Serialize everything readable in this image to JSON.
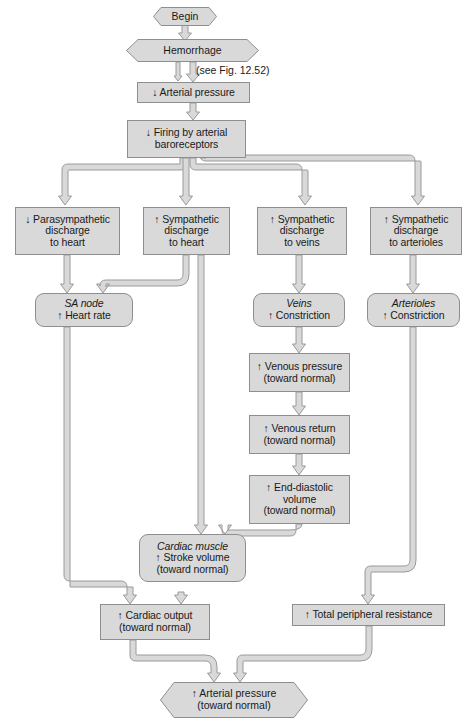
{
  "figure": {
    "type": "flowchart",
    "box_fill": "#d9d9d9",
    "box_stroke": "#8e8e8e",
    "connector_fill": "#d9d9d9",
    "connector_stroke": "#9a9a9a",
    "background": "#ffffff"
  },
  "annotations": {
    "figure_reference": "(see Fig. 12.52)"
  },
  "nodes": {
    "begin": {
      "label": "Begin",
      "shape": "hexagon"
    },
    "hemorrhage": {
      "label": "Hemorrhage",
      "shape": "hexagon"
    },
    "arterial_pressure_down": {
      "label": "↓ Arterial pressure",
      "shape": "rect"
    },
    "baroreceptors": {
      "line1": "↓ Firing by arterial",
      "line2": "baroreceptors",
      "shape": "rect"
    },
    "parasympathetic_heart": {
      "line1": "↓ Parasympathetic",
      "line2": "discharge",
      "line3": "to heart",
      "shape": "rect"
    },
    "sympathetic_heart": {
      "line1": "↑ Sympathetic",
      "line2": "discharge",
      "line3": "to heart",
      "shape": "rect"
    },
    "sympathetic_veins": {
      "line1": "↑ Sympathetic",
      "line2": "discharge",
      "line3": "to veins",
      "shape": "rect"
    },
    "sympathetic_arterioles": {
      "line1": "↑ Sympathetic",
      "line2": "discharge",
      "line3": "to arterioles",
      "shape": "rect"
    },
    "sa_node": {
      "organ": "SA node",
      "line1": "↑ Heart rate",
      "shape": "rounded-rect"
    },
    "veins": {
      "organ": "Veins",
      "line1": "↑ Constriction",
      "shape": "rounded-rect"
    },
    "arterioles": {
      "organ": "Arterioles",
      "line1": "↑ Constriction",
      "shape": "rounded-rect"
    },
    "venous_pressure": {
      "line1": "↑ Venous pressure",
      "line2": "(toward normal)",
      "shape": "rect"
    },
    "venous_return": {
      "line1": "↑ Venous return",
      "line2": "(toward normal)",
      "shape": "rect"
    },
    "end_diastolic_volume": {
      "line1": "↑ End-diastolic",
      "line2": "volume",
      "line3": "(toward normal)",
      "shape": "rect"
    },
    "cardiac_muscle": {
      "organ": "Cardiac muscle",
      "line1": "↑ Stroke volume",
      "line2": "(toward normal)",
      "shape": "rounded-rect"
    },
    "cardiac_output": {
      "line1": "↑ Cardiac output",
      "line2": "(toward normal)",
      "shape": "rect"
    },
    "total_peripheral_resistance": {
      "label": "↑ Total peripheral resistance",
      "shape": "rect"
    },
    "arterial_pressure_up": {
      "line1": "↑ Arterial pressure",
      "line2": "(toward normal)",
      "shape": "hexagon"
    }
  },
  "edges": [
    {
      "from": "begin",
      "to": "hemorrhage"
    },
    {
      "from": "hemorrhage",
      "to": "arterial_pressure_down"
    },
    {
      "from": "arterial_pressure_down",
      "to": "baroreceptors"
    },
    {
      "from": "baroreceptors",
      "to": "parasympathetic_heart"
    },
    {
      "from": "baroreceptors",
      "to": "sympathetic_heart"
    },
    {
      "from": "baroreceptors",
      "to": "sympathetic_veins"
    },
    {
      "from": "baroreceptors",
      "to": "sympathetic_arterioles"
    },
    {
      "from": "parasympathetic_heart",
      "to": "sa_node"
    },
    {
      "from": "sympathetic_heart",
      "to": "sa_node"
    },
    {
      "from": "sympathetic_heart",
      "to": "cardiac_muscle"
    },
    {
      "from": "sympathetic_veins",
      "to": "veins"
    },
    {
      "from": "sympathetic_arterioles",
      "to": "arterioles"
    },
    {
      "from": "veins",
      "to": "venous_pressure"
    },
    {
      "from": "venous_pressure",
      "to": "venous_return"
    },
    {
      "from": "venous_return",
      "to": "end_diastolic_volume"
    },
    {
      "from": "end_diastolic_volume",
      "to": "cardiac_muscle"
    },
    {
      "from": "sa_node",
      "to": "cardiac_output"
    },
    {
      "from": "cardiac_muscle",
      "to": "cardiac_output"
    },
    {
      "from": "arterioles",
      "to": "total_peripheral_resistance"
    },
    {
      "from": "cardiac_output",
      "to": "arterial_pressure_up"
    },
    {
      "from": "total_peripheral_resistance",
      "to": "arterial_pressure_up"
    }
  ]
}
